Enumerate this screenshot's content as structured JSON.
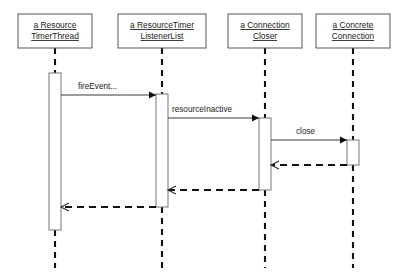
{
  "diagram": {
    "type": "uml-sequence-diagram",
    "background_color": "#ffffff",
    "line_color": "#111111",
    "box_stroke_color": "#555555",
    "text_color": "#1a1a1a"
  },
  "lifelines": [
    {
      "id": "resource-timer-thread",
      "name_line1": "a Resource",
      "name_line2": "TimerThread",
      "box": {
        "x": 18,
        "y": 14,
        "width": 74,
        "height": 34
      },
      "center_x": 55,
      "activation": {
        "x": 49,
        "y": 73,
        "width": 12,
        "height": 157
      }
    },
    {
      "id": "resource-timer-listener-list",
      "name_line1": "a ResourceTimer",
      "name_line2": "ListenerList",
      "box": {
        "x": 118,
        "y": 14,
        "width": 88,
        "height": 34
      },
      "center_x": 162,
      "activation": {
        "x": 156,
        "y": 94,
        "width": 12,
        "height": 113
      }
    },
    {
      "id": "connection-closer",
      "name_line1": "a Connection",
      "name_line2": "Closer",
      "box": {
        "x": 228,
        "y": 14,
        "width": 74,
        "height": 34
      },
      "center_x": 265,
      "activation": {
        "x": 259,
        "y": 118,
        "width": 12,
        "height": 72
      }
    },
    {
      "id": "concrete-connection",
      "name_line1": "a Concrete",
      "name_line2": "Connection",
      "box": {
        "x": 316,
        "y": 14,
        "width": 74,
        "height": 34
      },
      "center_x": 353,
      "activation": {
        "x": 347,
        "y": 140,
        "width": 12,
        "height": 25
      }
    }
  ],
  "messages": [
    {
      "id": "msg-fire-event",
      "label": "fireEvent...",
      "kind": "call",
      "style": "solid",
      "arrowhead": "filled",
      "from": "resource-timer-thread",
      "to": "resource-timer-listener-list",
      "x1": 61,
      "x2": 156,
      "y": 95,
      "label_x": 78,
      "label_y": 89
    },
    {
      "id": "msg-resource-inactive",
      "label": "resourceInactive",
      "kind": "call",
      "style": "solid",
      "arrowhead": "filled",
      "from": "resource-timer-listener-list",
      "to": "connection-closer",
      "x1": 168,
      "x2": 259,
      "y": 118,
      "label_x": 172,
      "label_y": 112
    },
    {
      "id": "msg-close",
      "label": "close",
      "kind": "call",
      "style": "solid",
      "arrowhead": "filled",
      "from": "connection-closer",
      "to": "concrete-connection",
      "x1": 271,
      "x2": 347,
      "y": 140,
      "label_x": 296,
      "label_y": 134
    },
    {
      "id": "msg-return-from-concrete-connection",
      "label": "",
      "kind": "return",
      "style": "dashed",
      "arrowhead": "open",
      "from": "concrete-connection",
      "to": "connection-closer",
      "x1": 347,
      "x2": 271,
      "y": 165,
      "label_x": 0,
      "label_y": 0
    },
    {
      "id": "msg-return-from-connection-closer",
      "label": "",
      "kind": "return",
      "style": "dashed",
      "arrowhead": "open",
      "from": "connection-closer",
      "to": "resource-timer-listener-list",
      "x1": 259,
      "x2": 168,
      "y": 190,
      "label_x": 0,
      "label_y": 0
    },
    {
      "id": "msg-return-from-listener-list",
      "label": "",
      "kind": "return",
      "style": "dashed",
      "arrowhead": "open",
      "from": "resource-timer-listener-list",
      "to": "resource-timer-thread",
      "x1": 156,
      "x2": 61,
      "y": 207,
      "label_x": 0,
      "label_y": 0
    }
  ],
  "lifeline_segments": [
    {
      "id": "seg-1-top",
      "lifeline": "resource-timer-thread",
      "x": 55,
      "y1": 48,
      "y2": 73
    },
    {
      "id": "seg-1-bottom",
      "lifeline": "resource-timer-thread",
      "x": 55,
      "y1": 230,
      "y2": 268
    },
    {
      "id": "seg-2-top",
      "lifeline": "resource-timer-listener-list",
      "x": 162,
      "y1": 48,
      "y2": 94
    },
    {
      "id": "seg-2-bottom",
      "lifeline": "resource-timer-listener-list",
      "x": 162,
      "y1": 207,
      "y2": 268
    },
    {
      "id": "seg-3-top",
      "lifeline": "connection-closer",
      "x": 265,
      "y1": 48,
      "y2": 118
    },
    {
      "id": "seg-3-bottom",
      "lifeline": "connection-closer",
      "x": 265,
      "y1": 190,
      "y2": 268
    },
    {
      "id": "seg-4-top",
      "lifeline": "concrete-connection",
      "x": 353,
      "y1": 48,
      "y2": 140
    },
    {
      "id": "seg-4-bottom",
      "lifeline": "concrete-connection",
      "x": 353,
      "y1": 165,
      "y2": 268
    }
  ]
}
